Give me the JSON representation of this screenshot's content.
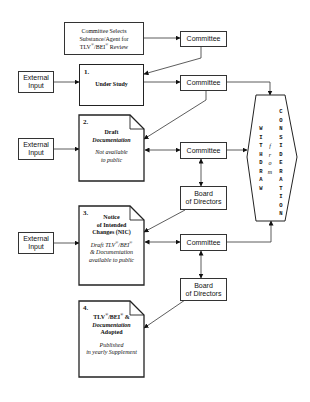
{
  "diagram": {
    "top_box": {
      "line1": "Committee Selects",
      "line2": "Substance/Agent for",
      "line3_prefix": "TLV",
      "line3_mid": "/BEI",
      "line3_suffix": " Review",
      "reg": "®"
    },
    "committee_label": "Committee",
    "board_line1": "Board",
    "board_line2": "of Directors",
    "external_line1": "External",
    "external_line2": "Input",
    "stage1": {
      "num": "1.",
      "title": "Under Study"
    },
    "stage2": {
      "num": "2.",
      "title": "Draft",
      "title2": "Documentation",
      "note1": "Not available",
      "note2": "to public"
    },
    "stage3": {
      "num": "3.",
      "title1": "Notice",
      "title2": "of Intended",
      "title3": "Changes (NIC)",
      "note1_prefix": "Draft TLV",
      "note1_mid": "/BEI",
      "note2": "& Documentation",
      "note3": "available to public"
    },
    "stage4": {
      "num": "4.",
      "title1_prefix": "TLV",
      "title1_mid": "/BEI",
      "title1_suffix": " &",
      "title2": "Documentation",
      "title3": "Adopted",
      "note1": "Published",
      "note2": "in yearly Supplement"
    },
    "withdraw": {
      "left": [
        "W",
        "I",
        "T",
        "H",
        "D",
        "R",
        "A",
        "W"
      ],
      "middle": [
        "f",
        "r",
        "o",
        "m"
      ],
      "right": [
        "C",
        "O",
        "N",
        "S",
        "I",
        "D",
        "E",
        "R",
        "A",
        "T",
        "I",
        "O",
        "N"
      ]
    }
  }
}
